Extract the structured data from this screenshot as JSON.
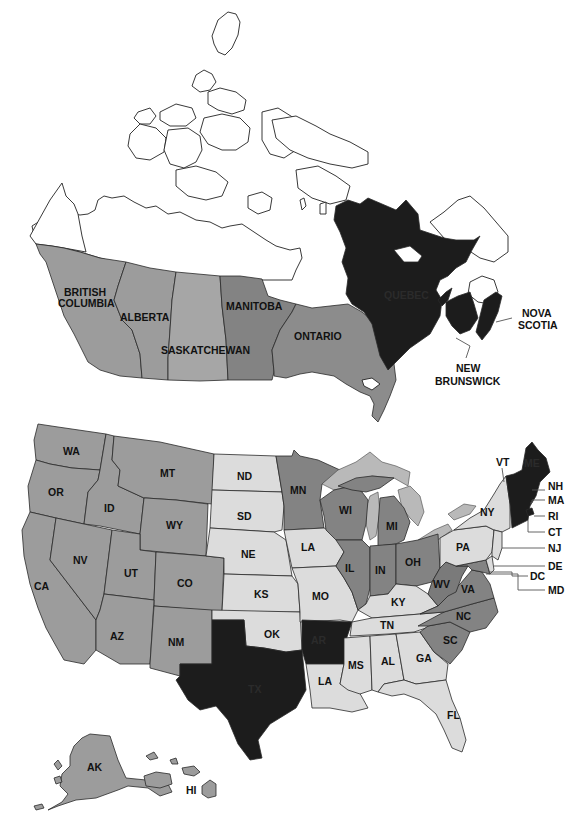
{
  "map": {
    "title": "",
    "shades": {
      "none": "#ffffff",
      "light": "#dcdcdc",
      "medium": "#9c9c9c",
      "dark": "#7c7c7c",
      "black": "#1c1c1c",
      "outline": "#222222"
    },
    "canada": {
      "provinces": [
        {
          "id": "bc",
          "label_line1": "BRITISH",
          "label_line2": "COLUMBIA",
          "shade": "medium"
        },
        {
          "id": "ab",
          "label": "ALBERTA",
          "shade": "medium"
        },
        {
          "id": "sk",
          "label": "SASKATCHEWAN",
          "shade": "medium"
        },
        {
          "id": "mb",
          "label": "MANITOBA",
          "shade": "dark"
        },
        {
          "id": "on",
          "label": "ONTARIO",
          "shade": "dark"
        },
        {
          "id": "qc",
          "label": "QUEBEC",
          "shade": "black"
        },
        {
          "id": "nb",
          "label_line1": "NEW",
          "label_line2": "BRUNSWICK",
          "shade": "black"
        },
        {
          "id": "ns",
          "label_line1": "NOVA",
          "label_line2": "SCOTIA",
          "shade": "black"
        },
        {
          "id": "territories",
          "label": "",
          "shade": "none"
        },
        {
          "id": "nl",
          "label": "",
          "shade": "none"
        }
      ]
    },
    "usa": {
      "states": [
        {
          "id": "WA",
          "label": "WA",
          "shade": "medium"
        },
        {
          "id": "OR",
          "label": "OR",
          "shade": "medium"
        },
        {
          "id": "CA",
          "label": "CA",
          "shade": "medium"
        },
        {
          "id": "ID",
          "label": "ID",
          "shade": "medium"
        },
        {
          "id": "NV",
          "label": "NV",
          "shade": "medium"
        },
        {
          "id": "MT",
          "label": "MT",
          "shade": "medium"
        },
        {
          "id": "WY",
          "label": "WY",
          "shade": "medium"
        },
        {
          "id": "UT",
          "label": "UT",
          "shade": "medium"
        },
        {
          "id": "CO",
          "label": "CO",
          "shade": "medium"
        },
        {
          "id": "AZ",
          "label": "AZ",
          "shade": "medium"
        },
        {
          "id": "NM",
          "label": "NM",
          "shade": "medium"
        },
        {
          "id": "ND",
          "label": "ND",
          "shade": "light"
        },
        {
          "id": "SD",
          "label": "SD",
          "shade": "light"
        },
        {
          "id": "NE",
          "label": "NE",
          "shade": "light"
        },
        {
          "id": "KS",
          "label": "KS",
          "shade": "light"
        },
        {
          "id": "OK",
          "label": "OK",
          "shade": "light"
        },
        {
          "id": "TX",
          "label": "TX",
          "shade": "black"
        },
        {
          "id": "MN",
          "label": "MN",
          "shade": "dark"
        },
        {
          "id": "IA",
          "label": "LA",
          "shade": "light"
        },
        {
          "id": "MO",
          "label": "MO",
          "shade": "light"
        },
        {
          "id": "AR",
          "label": "AR",
          "shade": "black"
        },
        {
          "id": "LA",
          "label": "LA",
          "shade": "light"
        },
        {
          "id": "WI",
          "label": "WI",
          "shade": "dark"
        },
        {
          "id": "IL",
          "label": "IL",
          "shade": "dark"
        },
        {
          "id": "MI",
          "label": "MI",
          "shade": "dark"
        },
        {
          "id": "IN",
          "label": "IN",
          "shade": "dark"
        },
        {
          "id": "OH",
          "label": "OH",
          "shade": "dark"
        },
        {
          "id": "KY",
          "label": "KY",
          "shade": "light"
        },
        {
          "id": "TN",
          "label": "TN",
          "shade": "light"
        },
        {
          "id": "MS",
          "label": "MS",
          "shade": "light"
        },
        {
          "id": "AL",
          "label": "AL",
          "shade": "light"
        },
        {
          "id": "GA",
          "label": "GA",
          "shade": "light"
        },
        {
          "id": "FL",
          "label": "FL",
          "shade": "light"
        },
        {
          "id": "SC",
          "label": "SC",
          "shade": "dark"
        },
        {
          "id": "NC",
          "label": "NC",
          "shade": "dark"
        },
        {
          "id": "VA",
          "label": "VA",
          "shade": "dark"
        },
        {
          "id": "WV",
          "label": "WV",
          "shade": "dark"
        },
        {
          "id": "MD",
          "label": "MD",
          "shade": "dark"
        },
        {
          "id": "DC",
          "label": "DC",
          "shade": "dark"
        },
        {
          "id": "DE",
          "label": "DE",
          "shade": "light"
        },
        {
          "id": "PA",
          "label": "PA",
          "shade": "light"
        },
        {
          "id": "NJ",
          "label": "NJ",
          "shade": "light"
        },
        {
          "id": "NY",
          "label": "NY",
          "shade": "light"
        },
        {
          "id": "CT",
          "label": "CT",
          "shade": "black"
        },
        {
          "id": "RI",
          "label": "RI",
          "shade": "black"
        },
        {
          "id": "MA",
          "label": "MA",
          "shade": "black"
        },
        {
          "id": "VT",
          "label": "VT",
          "shade": "black"
        },
        {
          "id": "NH",
          "label": "NH",
          "shade": "black"
        },
        {
          "id": "ME",
          "label": "ME",
          "shade": "black"
        },
        {
          "id": "AK",
          "label": "AK",
          "shade": "medium"
        },
        {
          "id": "HI",
          "label": "HI",
          "shade": "medium"
        }
      ]
    }
  }
}
